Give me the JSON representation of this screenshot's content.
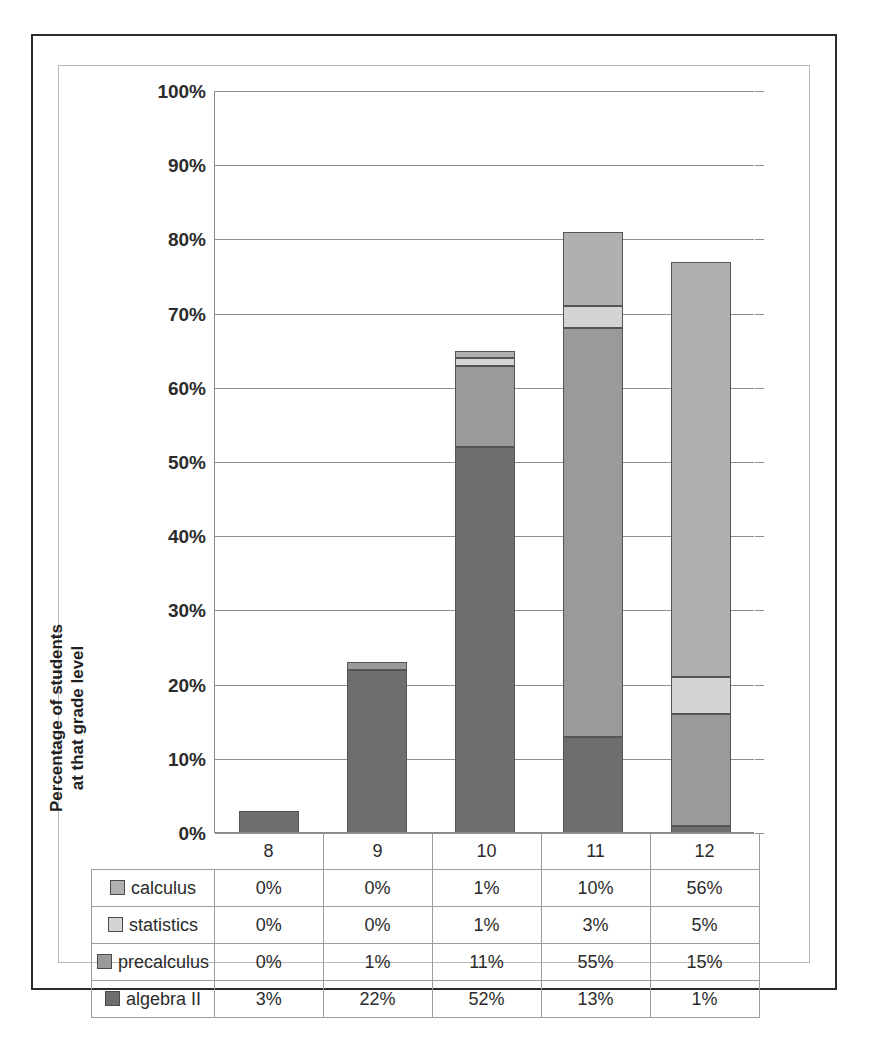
{
  "chart_data": {
    "type": "bar",
    "subtype": "stacked-column",
    "title": "",
    "xlabel": "",
    "ylabel": "Percentage of students\nat that grade level",
    "categories": [
      "8",
      "9",
      "10",
      "11",
      "12"
    ],
    "ylim": [
      0,
      100
    ],
    "ytick_labels": [
      "0%",
      "10%",
      "20%",
      "30%",
      "40%",
      "50%",
      "60%",
      "70%",
      "80%",
      "90%",
      "100%"
    ],
    "ytick_values": [
      0,
      10,
      20,
      30,
      40,
      50,
      60,
      70,
      80,
      90,
      100
    ],
    "grid": true,
    "legend_position": "data-table-left",
    "stack_order_bottom_to_top": [
      "algebra II",
      "precalculus",
      "statistics",
      "calculus"
    ],
    "series": [
      {
        "name": "calculus",
        "color": "#b0b0b0",
        "values": [
          0,
          0,
          1,
          10,
          56
        ],
        "labels": [
          "0%",
          "0%",
          "1%",
          "10%",
          "56%"
        ]
      },
      {
        "name": "statistics",
        "color": "#d4d4d4",
        "values": [
          0,
          0,
          1,
          3,
          5
        ],
        "labels": [
          "0%",
          "0%",
          "1%",
          "3%",
          "5%"
        ]
      },
      {
        "name": "precalculus",
        "color": "#9a9a9a",
        "values": [
          0,
          1,
          11,
          55,
          15
        ],
        "labels": [
          "0%",
          "1%",
          "11%",
          "55%",
          "15%"
        ]
      },
      {
        "name": "algebra II",
        "color": "#6e6e6e",
        "values": [
          3,
          22,
          52,
          13,
          1
        ],
        "labels": [
          "3%",
          "22%",
          "52%",
          "13%",
          "1%"
        ]
      }
    ],
    "column_totals": [
      3,
      23,
      65,
      81,
      77
    ]
  },
  "table": {
    "corner_label": "",
    "column_headers": [
      "8",
      "9",
      "10",
      "11",
      "12"
    ],
    "rows": [
      {
        "series": "calculus",
        "swatch_color": "#b0b0b0",
        "cells": [
          "0%",
          "0%",
          "1%",
          "10%",
          "56%"
        ]
      },
      {
        "series": "statistics",
        "swatch_color": "#d4d4d4",
        "cells": [
          "0%",
          "0%",
          "1%",
          "3%",
          "5%"
        ]
      },
      {
        "series": "precalculus",
        "swatch_color": "#9a9a9a",
        "cells": [
          "0%",
          "1%",
          "11%",
          "55%",
          "15%"
        ]
      },
      {
        "series": "algebra II",
        "swatch_color": "#6e6e6e",
        "cells": [
          "3%",
          "22%",
          "52%",
          "13%",
          "1%"
        ]
      }
    ]
  },
  "colors": {
    "page_background": "#ffffff",
    "outer_border": "#2b2b2b",
    "inner_border": "#b8b8b8",
    "gridline": "#8f8f8f",
    "axis_line": "#8a8a8a",
    "text": "#262626",
    "bar_outline": "#555555"
  }
}
